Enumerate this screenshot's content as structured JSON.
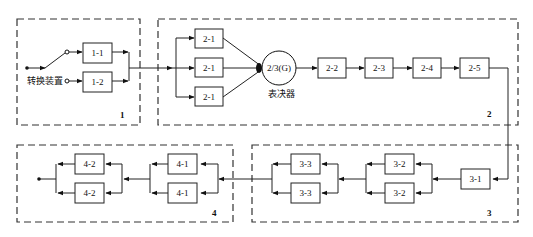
{
  "diagram": {
    "type": "reliability-block-diagram",
    "groups": [
      {
        "id": "1",
        "label": "1"
      },
      {
        "id": "2",
        "label": "2"
      },
      {
        "id": "3",
        "label": "3"
      },
      {
        "id": "4",
        "label": "4"
      }
    ],
    "switch_label": "转换装置",
    "voter": {
      "label": "2/3(G)",
      "caption": "表决器"
    },
    "blocks": {
      "b1_1": "1-1",
      "b1_2": "1-2",
      "b2_1a": "2-1",
      "b2_1b": "2-1",
      "b2_1c": "2-1",
      "b2_2": "2-2",
      "b2_3": "2-3",
      "b2_4": "2-4",
      "b2_5": "2-5",
      "b3_1": "3-1",
      "b3_2a": "3-2",
      "b3_2b": "3-2",
      "b3_3a": "3-3",
      "b3_3b": "3-3",
      "b4_1a": "4-1",
      "b4_1b": "4-1",
      "b4_2a": "4-2",
      "b4_2b": "4-2"
    }
  }
}
